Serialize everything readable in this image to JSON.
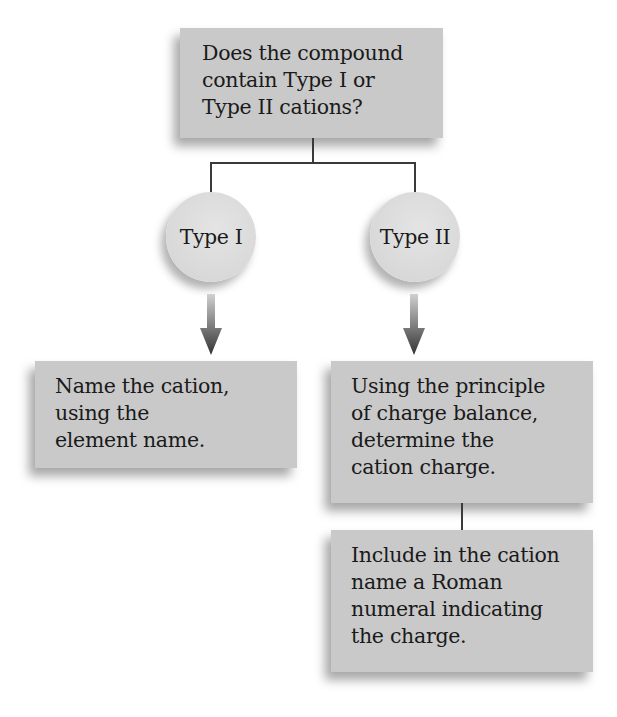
{
  "diagram": {
    "type": "flowchart",
    "question": {
      "lines": [
        "Does the compound",
        "contain Type I or",
        "Type II cations?"
      ]
    },
    "branches": [
      {
        "label": "Type I",
        "steps": [
          {
            "lines": [
              "Name the cation,",
              "using the",
              "element name."
            ]
          }
        ]
      },
      {
        "label": "Type II",
        "steps": [
          {
            "lines": [
              "Using the principle",
              "of charge balance,",
              "determine the",
              "cation charge."
            ]
          },
          {
            "lines": [
              "Include in the cation",
              "name a Roman",
              "numeral indicating",
              "the charge."
            ]
          }
        ]
      }
    ],
    "colors": {
      "box_fill": "#c9c9c9",
      "circle_fill": "#dadada",
      "connector": "#3a3a3a",
      "arrow_top": "#c8c8c8",
      "arrow_bottom": "#3a3a3a",
      "text": "#1a1a1a"
    }
  }
}
